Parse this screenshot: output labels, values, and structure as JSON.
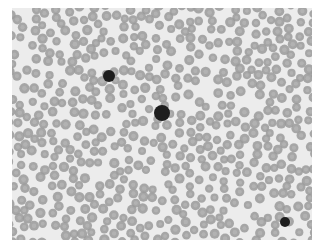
{
  "image": {
    "subject": "blood smear micrograph",
    "background_color": "#ffffff",
    "field_color": "#ececec",
    "rbc_color": "#9a9a9a",
    "rbc_center_color": "#b8b8b8",
    "wbc_color": "#1e1e1e",
    "dark_cells": [
      {
        "x": 97,
        "y": 68,
        "r": 6
      },
      {
        "x": 150,
        "y": 105,
        "r": 8
      },
      {
        "x": 273,
        "y": 214,
        "r": 5
      }
    ]
  }
}
